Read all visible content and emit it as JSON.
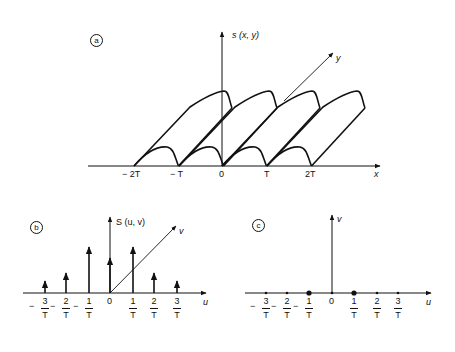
{
  "panel_a": {
    "tag": "a",
    "vertical_axis_label": "s (x, y)",
    "depth_axis_label": "y",
    "horizontal_axis_label": "x",
    "tick_labels": [
      "− 2T",
      "− T",
      "0",
      "T",
      "2T"
    ],
    "tick_x": [
      134,
      179,
      222,
      267,
      311
    ],
    "period_px": 44.5,
    "baseline_y": 166,
    "hump_starts_x": [
      134,
      179,
      222,
      267
    ]
  },
  "panel_b": {
    "tag": "b",
    "vertical_axis_label": "S (u, v)",
    "depth_axis_label": "v",
    "horizontal_axis_label": "u",
    "baseline_y": 293,
    "ticks": [
      {
        "sign": "−",
        "num": "3",
        "den": "T",
        "x": 45,
        "stem_top": 281
      },
      {
        "sign": "−",
        "num": "2",
        "den": "T",
        "x": 66,
        "stem_top": 273
      },
      {
        "sign": "−",
        "num": "1",
        "den": "T",
        "x": 89,
        "stem_top": 247
      },
      {
        "sign": "",
        "num": "0",
        "den": "",
        "x": 110,
        "stem_top": 258
      },
      {
        "sign": "",
        "num": "1",
        "den": "T",
        "x": 133,
        "stem_top": 247
      },
      {
        "sign": "",
        "num": "2",
        "den": "T",
        "x": 154,
        "stem_top": 273
      },
      {
        "sign": "",
        "num": "3",
        "den": "T",
        "x": 177,
        "stem_top": 281
      }
    ]
  },
  "panel_c": {
    "tag": "c",
    "vertical_axis_label": "v",
    "horizontal_axis_label": "u",
    "baseline_y": 293,
    "ticks": [
      {
        "sign": "−",
        "num": "3",
        "den": "T",
        "x": 266,
        "dot": "small"
      },
      {
        "sign": "−",
        "num": "2",
        "den": "T",
        "x": 287,
        "dot": "small"
      },
      {
        "sign": "−",
        "num": "1",
        "den": "T",
        "x": 309,
        "dot": "large"
      },
      {
        "sign": "",
        "num": "0",
        "den": "",
        "x": 332,
        "dot": "small"
      },
      {
        "sign": "",
        "num": "1",
        "den": "T",
        "x": 354,
        "dot": "large"
      },
      {
        "sign": "",
        "num": "2",
        "den": "T",
        "x": 377,
        "dot": "small"
      },
      {
        "sign": "",
        "num": "3",
        "den": "T",
        "x": 398,
        "dot": "small"
      }
    ]
  }
}
